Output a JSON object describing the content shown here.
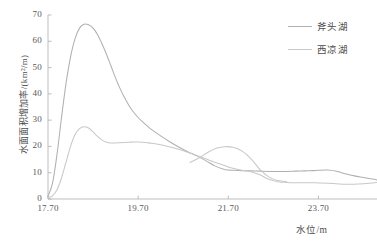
{
  "chart_data": {
    "type": "line",
    "title": "",
    "xlabel": "水位/m",
    "ylabel": "水面面积增加率/(km²/m)",
    "xlim": [
      17.7,
      25.0
    ],
    "ylim": [
      0,
      70
    ],
    "xticks": [
      "17.70",
      "19.70",
      "21.70",
      "23.70"
    ],
    "xtick_values": [
      17.7,
      19.7,
      21.7,
      23.7
    ],
    "yticks": [
      "0",
      "10",
      "20",
      "30",
      "40",
      "50",
      "60",
      "70"
    ],
    "ytick_values": [
      0,
      10,
      20,
      30,
      40,
      50,
      60,
      70
    ],
    "grid": false,
    "legend_position": "upper right",
    "x": [
      17.7,
      17.8,
      17.9,
      18.0,
      18.1,
      18.2,
      18.3,
      18.4,
      18.5,
      18.6,
      18.7,
      18.8,
      18.9,
      19.0,
      19.1,
      19.2,
      19.3,
      19.4,
      19.5,
      19.6,
      19.7,
      19.8,
      19.9,
      20.0,
      20.2,
      20.4,
      20.6,
      20.8,
      21.0,
      21.2,
      21.4,
      21.6,
      21.7,
      21.8,
      22.0,
      22.2,
      22.4,
      22.6,
      22.8,
      23.0,
      23.2,
      23.4,
      23.6,
      23.7,
      23.9,
      24.1,
      24.3,
      24.5,
      24.7,
      24.9,
      25.0
    ],
    "series": [
      {
        "name": "斧头湖",
        "color": "#b0b0b0",
        "values": [
          1.0,
          6.0,
          17.0,
          31.0,
          44.0,
          54.0,
          61.0,
          65.0,
          66.5,
          66.3,
          65.0,
          62.5,
          59.0,
          55.0,
          50.5,
          46.0,
          42.0,
          38.5,
          35.5,
          33.0,
          31.0,
          29.3,
          27.8,
          26.4,
          24.0,
          21.8,
          19.8,
          18.0,
          16.4,
          14.6,
          12.6,
          11.3,
          11.0,
          10.9,
          10.8,
          10.7,
          10.6,
          10.5,
          10.5,
          10.5,
          10.6,
          10.7,
          10.8,
          10.9,
          11.0,
          10.6,
          9.6,
          8.8,
          8.2,
          7.6,
          7.2
        ]
      },
      {
        "name": "西凉湖",
        "color": "#c8c8c8",
        "values": [
          0.5,
          1.2,
          3.5,
          8.0,
          14.0,
          20.0,
          24.5,
          26.8,
          27.5,
          27.0,
          25.5,
          23.8,
          22.4,
          21.6,
          21.3,
          21.3,
          21.4,
          21.5,
          21.6,
          21.7,
          21.7,
          21.6,
          21.4,
          21.2,
          20.6,
          19.8,
          18.9,
          17.8,
          16.6,
          15.3,
          14.0,
          12.8,
          12.2,
          11.7,
          10.9,
          10.4,
          9.2,
          7.5,
          6.6,
          6.3,
          6.2,
          6.2,
          6.2,
          6.1,
          6.0,
          5.8,
          5.6,
          5.6,
          5.8,
          6.1,
          6.3
        ]
      },
      {
        "name": "西凉湖-bump",
        "color": "#c8c8c8",
        "values": [
          0,
          0,
          0,
          0,
          0,
          0,
          0,
          0,
          0,
          0,
          0,
          0,
          0,
          0,
          0,
          0,
          0,
          0,
          0,
          0,
          0,
          0,
          0,
          0,
          0,
          0,
          0,
          0,
          0,
          0,
          0,
          0,
          0,
          0,
          0,
          0,
          0,
          0,
          0,
          0,
          0,
          0,
          0,
          0,
          0,
          0,
          0,
          0,
          0,
          0,
          0
        ]
      }
    ],
    "annotations": [
      {
        "text": "斧头湖 peak",
        "x": 18.5,
        "y": 66.5
      },
      {
        "text": "西凉湖 first peak",
        "x": 18.5,
        "y": 27.5
      },
      {
        "text": "西凉湖 secondary bump",
        "x": 21.7,
        "y": 20.0
      }
    ]
  },
  "legend": {
    "items": [
      {
        "label": "斧头湖",
        "color": "#b0b0b0"
      },
      {
        "label": "西凉湖",
        "color": "#c8c8c8"
      }
    ]
  },
  "axes": {
    "x_title": "水位/m",
    "y_title": "水面面积增加率/(km²/m)"
  }
}
